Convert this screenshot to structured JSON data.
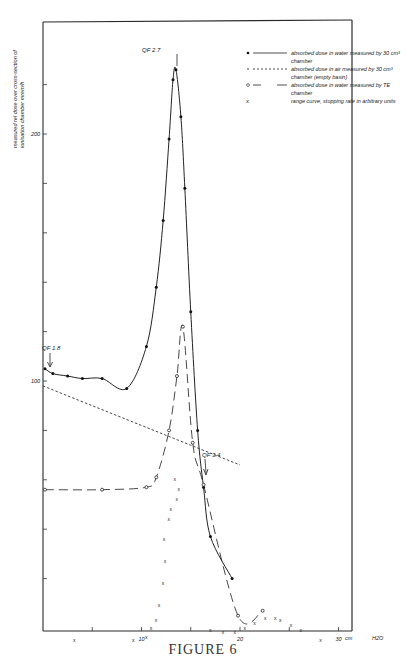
{
  "figure": {
    "caption": "FIGURE 6",
    "ylabel": "measured rel dose over cross-section of ionisation chamber mrem/h",
    "xlabel_unit": "cm  H2O",
    "annotations": {
      "qf_peak": "QF 2.7",
      "qf_entry": "QF 1.8",
      "qf_tail": "QF 3.4"
    },
    "legend": [
      {
        "symbol": "filled-dot-solid-line",
        "text": "absorbed dose in water measured by 30 cm³ chamber"
      },
      {
        "symbol": "dotted-line",
        "text": "absorbed dose in air measured by 30 cm³ chamber (empty basin)"
      },
      {
        "symbol": "open-circle-dashed-line",
        "text": "absorbed dose in water measured by TE chamber"
      },
      {
        "symbol": "cross",
        "text": "range curve, stopping rate in arbitrary units"
      }
    ]
  },
  "chart_data": {
    "type": "line",
    "title": "FIGURE 6",
    "xlabel": "cm H2O",
    "ylabel": "measured rel dose over cross-section of ionisation chamber mrem/h",
    "xlim": [
      0,
      32
    ],
    "ylim": [
      0,
      245
    ],
    "x_ticks": [
      0,
      5,
      10,
      15,
      20,
      25,
      30
    ],
    "x_tick_labels": [
      "",
      "",
      "10",
      "",
      "20",
      "",
      "30"
    ],
    "y_ticks": [
      20,
      40,
      60,
      80,
      100,
      120,
      140,
      160,
      180,
      200,
      220
    ],
    "y_tick_labels": {
      "100": "100",
      "200": "200"
    },
    "grid": false,
    "legend_position": "upper right",
    "series": [
      {
        "name": "absorbed dose in water measured by 30 cm³ chamber",
        "style": "solid line, filled dots",
        "points": [
          [
            0.2,
            105
          ],
          [
            1,
            103
          ],
          [
            2.5,
            102
          ],
          [
            4,
            101
          ],
          [
            6,
            101
          ],
          [
            8.5,
            97
          ],
          [
            10.5,
            114
          ],
          [
            11.5,
            138
          ],
          [
            12.2,
            165
          ],
          [
            12.8,
            198
          ],
          [
            13.2,
            222
          ],
          [
            13.5,
            226
          ],
          [
            14,
            207
          ],
          [
            14.4,
            178
          ],
          [
            15,
            128
          ],
          [
            15.7,
            80
          ],
          [
            16.3,
            57
          ],
          [
            17,
            37
          ],
          [
            19.2,
            20
          ]
        ]
      },
      {
        "name": "absorbed dose in air measured by 30 cm³ chamber (empty basin)",
        "style": "dotted line",
        "points": [
          [
            0,
            98
          ],
          [
            5,
            90
          ],
          [
            10,
            82
          ],
          [
            15,
            74
          ],
          [
            20,
            66
          ]
        ]
      },
      {
        "name": "absorbed dose in water measured by TE chamber",
        "style": "dashed line, open circles",
        "points": [
          [
            0.2,
            56
          ],
          [
            6,
            56
          ],
          [
            10.5,
            57
          ],
          [
            11.5,
            61
          ],
          [
            12.8,
            80
          ],
          [
            13.6,
            102
          ],
          [
            14.2,
            122
          ],
          [
            15.2,
            75
          ],
          [
            16.3,
            58
          ],
          [
            19.8,
            5
          ],
          [
            22.3,
            7
          ]
        ]
      },
      {
        "name": "range curve, stopping rate in arbitrary units",
        "style": "crosses",
        "points": [
          [
            3.2,
            -5
          ],
          [
            9.2,
            -5
          ],
          [
            10.5,
            -4
          ],
          [
            11,
            0
          ],
          [
            11.5,
            3
          ],
          [
            11.8,
            9
          ],
          [
            12.2,
            18
          ],
          [
            12.4,
            27
          ],
          [
            12.3,
            36
          ],
          [
            12.8,
            44
          ],
          [
            13,
            48
          ],
          [
            13.6,
            52
          ],
          [
            13.8,
            56
          ],
          [
            13.4,
            60
          ],
          [
            17,
            -1
          ],
          [
            18.3,
            -2
          ],
          [
            19.5,
            -2
          ],
          [
            20.5,
            0
          ],
          [
            21.5,
            2
          ],
          [
            22.6,
            4
          ],
          [
            23.6,
            4
          ],
          [
            24.1,
            3
          ],
          [
            25.2,
            1
          ],
          [
            26.2,
            -1
          ],
          [
            28.2,
            -5
          ]
        ]
      }
    ]
  }
}
